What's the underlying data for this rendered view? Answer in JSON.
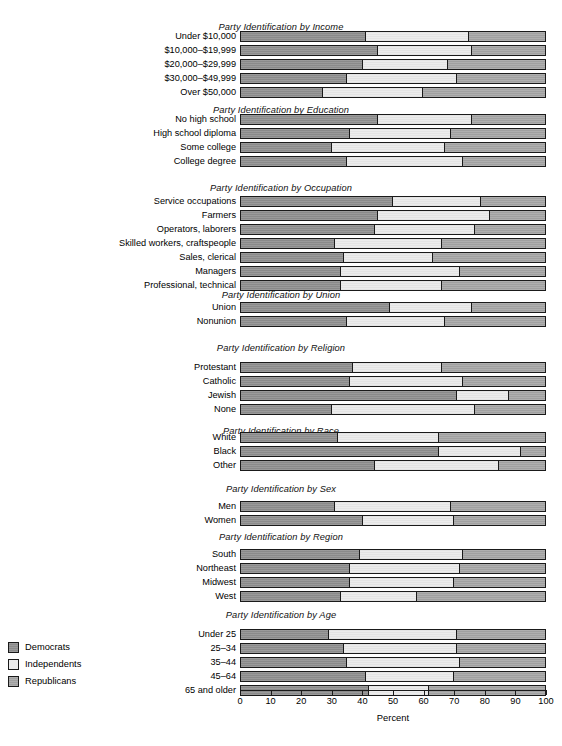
{
  "chart_data": {
    "type": "bar",
    "subtype": "stacked-horizontal-100",
    "title": "",
    "xlabel": "Percent",
    "ylabel": "",
    "xlim": [
      0,
      100
    ],
    "xticks": [
      0,
      10,
      20,
      30,
      40,
      50,
      60,
      70,
      80,
      90,
      100
    ],
    "xticklabels": [
      "0",
      "10",
      "20",
      "30",
      "40",
      "50",
      "60",
      "70",
      "80",
      "90",
      "100"
    ],
    "grid": false,
    "legend_position": "bottom-left",
    "series": [
      {
        "name": "Democrats",
        "color": "#8a8a8a"
      },
      {
        "name": "Independents",
        "color": "#ececec"
      },
      {
        "name": "Republicans",
        "color": "#a0a0a0"
      }
    ],
    "panels": [
      {
        "title": "Party Identification by Income",
        "categories": [
          "Under $10,000",
          "$10,000–$19,999",
          "$20,000–$29,999",
          "$30,000–$49,999",
          "Over $50,000"
        ],
        "values": [
          [
            41,
            34,
            25
          ],
          [
            45,
            31,
            24
          ],
          [
            40,
            28,
            32
          ],
          [
            35,
            36,
            29
          ],
          [
            27,
            33,
            40
          ]
        ]
      },
      {
        "title": "Party Identification by Education",
        "categories": [
          "No high school",
          "High school diploma",
          "Some college",
          "College degree"
        ],
        "values": [
          [
            45,
            31,
            24
          ],
          [
            36,
            33,
            31
          ],
          [
            30,
            37,
            33
          ],
          [
            35,
            38,
            27
          ]
        ]
      },
      {
        "title": "Party Identification by Occupation",
        "categories": [
          "Service occupations",
          "Farmers",
          "Operators, laborers",
          "Skilled workers, craftspeople",
          "Sales, clerical",
          "Managers",
          "Professional, technical"
        ],
        "values": [
          [
            50,
            29,
            21
          ],
          [
            45,
            37,
            18
          ],
          [
            44,
            33,
            23
          ],
          [
            31,
            35,
            34
          ],
          [
            34,
            29,
            37
          ],
          [
            33,
            39,
            28
          ],
          [
            33,
            33,
            34
          ]
        ]
      },
      {
        "title": "Party Identification by Union",
        "categories": [
          "Union",
          "Nonunion"
        ],
        "values": [
          [
            49,
            27,
            24
          ],
          [
            35,
            32,
            33
          ]
        ]
      },
      {
        "title": "Party Identification by Religion",
        "categories": [
          "Protestant",
          "Catholic",
          "Jewish",
          "None"
        ],
        "values": [
          [
            37,
            29,
            34
          ],
          [
            36,
            37,
            27
          ],
          [
            71,
            17,
            12
          ],
          [
            30,
            47,
            23
          ]
        ]
      },
      {
        "title": "Party Identification by Race",
        "categories": [
          "White",
          "Black",
          "Other"
        ],
        "values": [
          [
            32,
            33,
            35
          ],
          [
            65,
            27,
            8
          ],
          [
            44,
            41,
            15
          ]
        ]
      },
      {
        "title": "Party Identification by Sex",
        "categories": [
          "Men",
          "Women"
        ],
        "values": [
          [
            31,
            38,
            31
          ],
          [
            40,
            30,
            30
          ]
        ]
      },
      {
        "title": "Party Identification by Region",
        "categories": [
          "South",
          "Northeast",
          "Midwest",
          "West"
        ],
        "values": [
          [
            39,
            34,
            27
          ],
          [
            36,
            36,
            28
          ],
          [
            36,
            34,
            30
          ],
          [
            33,
            25,
            42
          ]
        ]
      },
      {
        "title": "Party Identification by Age",
        "categories": [
          "Under 25",
          "25–34",
          "35–44",
          "45–64",
          "65 and older"
        ],
        "values": [
          [
            29,
            42,
            29
          ],
          [
            34,
            37,
            29
          ],
          [
            35,
            37,
            28
          ],
          [
            41,
            29,
            30
          ],
          [
            42,
            20,
            38
          ]
        ]
      }
    ]
  },
  "legend": {
    "items": [
      {
        "label": "Democrats",
        "color": "#8a8a8a"
      },
      {
        "label": "Independents",
        "color": "#ececec"
      },
      {
        "label": "Republicans",
        "color": "#a0a0a0"
      }
    ]
  },
  "axis": {
    "title": "Percent",
    "ticks": [
      "0",
      "10",
      "20",
      "30",
      "40",
      "50",
      "60",
      "70",
      "80",
      "90",
      "100"
    ]
  },
  "layout": {
    "plot_left_px": 240,
    "plot_right_px": 546,
    "label_right_px": 236,
    "row_height_px": 11,
    "row_gap_px": 3,
    "panel_tops_px": [
      22,
      105,
      183,
      290,
      343,
      426,
      484,
      532,
      610
    ],
    "panel_first_row_px": [
      31,
      114,
      196,
      302,
      362,
      432,
      501,
      549,
      629
    ]
  }
}
